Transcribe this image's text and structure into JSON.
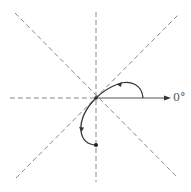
{
  "diagram": {
    "type": "polar-plot",
    "axis_label": "0°",
    "colors": {
      "dashed": "#888888",
      "curve": "#333333",
      "axis": "#555555"
    }
  }
}
